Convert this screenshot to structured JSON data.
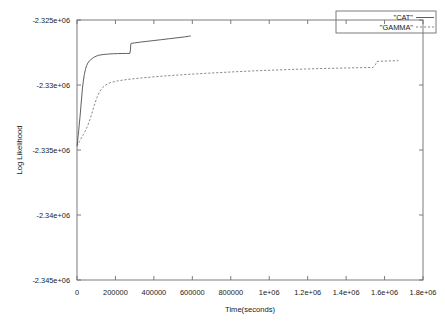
{
  "chart_data": {
    "type": "line",
    "title": "",
    "xlabel": "Time(seconds)",
    "ylabel": "Log Likelihood",
    "xlim": [
      0,
      1800000
    ],
    "ylim": [
      -2345000,
      -2325000
    ],
    "grid": false,
    "legend_position": "top-right",
    "xticks": [
      0,
      200000,
      400000,
      600000,
      800000,
      1000000,
      1200000,
      1400000,
      1600000,
      1800000
    ],
    "xtick_labels": [
      "0",
      "200000",
      "400000",
      "600000",
      "800000",
      "1e+06",
      "1.2e+06",
      "1.4e+06",
      "1.6e+06",
      "1.8e+06"
    ],
    "yticks": [
      -2325000,
      -2330000,
      -2335000,
      -2340000,
      -2345000
    ],
    "ytick_labels": [
      "-2.325e+06",
      "-2.33e+06",
      "-2.335e+06",
      "-2.34e+06",
      "-2.345e+06"
    ],
    "series": [
      {
        "name": "\"CAT\"",
        "style": "solid",
        "color": "#4d4d4d",
        "x": [
          1000,
          3000,
          6000,
          9000,
          12000,
          16000,
          20000,
          24000,
          28000,
          33000,
          38000,
          44000,
          50000,
          57000,
          64000,
          72000,
          80000,
          90000,
          100000,
          112000,
          125000,
          140000,
          155000,
          170000,
          190000,
          210000,
          235000,
          258000,
          275000,
          278000,
          280000,
          282000,
          300000,
          330000,
          360000,
          400000,
          440000,
          480000,
          520000,
          560000,
          585000,
          592000
        ],
        "y": [
          -2334700,
          -2334350,
          -2333900,
          -2333500,
          -2333000,
          -2332400,
          -2331700,
          -2331000,
          -2330300,
          -2329700,
          -2329200,
          -2328800,
          -2328500,
          -2328300,
          -2328150,
          -2328050,
          -2327950,
          -2327850,
          -2327780,
          -2327720,
          -2327680,
          -2327650,
          -2327630,
          -2327610,
          -2327595,
          -2327585,
          -2327578,
          -2327572,
          -2327570,
          -2327300,
          -2326850,
          -2326800,
          -2326760,
          -2326700,
          -2326650,
          -2326580,
          -2326510,
          -2326440,
          -2326370,
          -2326300,
          -2326240,
          -2326220
        ]
      },
      {
        "name": "\"GAMMA\"",
        "style": "dashed",
        "color": "#7a7a7a",
        "x": [
          1000,
          4000,
          8000,
          13000,
          19000,
          26000,
          34000,
          43000,
          53000,
          64000,
          76000,
          89000,
          103000,
          118000,
          134000,
          151000,
          169000,
          188000,
          210000,
          235000,
          265000,
          300000,
          340000,
          385000,
          435000,
          490000,
          550000,
          615000,
          685000,
          760000,
          840000,
          925000,
          1010000,
          1100000,
          1190000,
          1280000,
          1370000,
          1460000,
          1540000,
          1552000,
          1560000,
          1570000,
          1600000,
          1640000,
          1672000
        ],
        "y": [
          -2334720,
          -2334600,
          -2334480,
          -2334340,
          -2334180,
          -2334000,
          -2333790,
          -2333540,
          -2333220,
          -2332800,
          -2332250,
          -2331600,
          -2330980,
          -2330500,
          -2330180,
          -2329980,
          -2329850,
          -2329760,
          -2329690,
          -2329630,
          -2329570,
          -2329510,
          -2329450,
          -2329390,
          -2329330,
          -2329270,
          -2329210,
          -2329150,
          -2329090,
          -2329030,
          -2328970,
          -2328910,
          -2328860,
          -2328810,
          -2328770,
          -2328730,
          -2328700,
          -2328670,
          -2328650,
          -2328450,
          -2328200,
          -2328180,
          -2328160,
          -2328140,
          -2328130
        ]
      }
    ]
  },
  "legend": {
    "entries": [
      {
        "label": "\"CAT\""
      },
      {
        "label": "\"GAMMA\""
      }
    ]
  }
}
